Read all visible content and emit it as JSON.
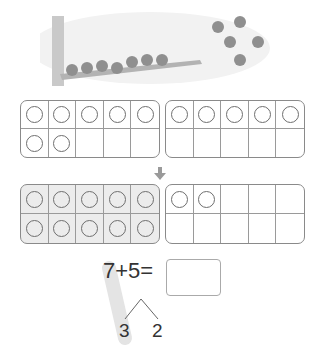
{
  "illustration": {
    "description": "Birds on a tree branch and birds flying",
    "birds_on_branch": 7,
    "birds_flying": 5
  },
  "top_frames": {
    "left": {
      "counters": 7
    },
    "right": {
      "counters": 5
    }
  },
  "arrow": "down-arrow",
  "bottom_frames": {
    "left": {
      "counters": 10,
      "highlighted": true
    },
    "right": {
      "counters": 2
    }
  },
  "equation": {
    "text": "7+5=",
    "answer": "",
    "split_left": "3",
    "split_right": "2"
  },
  "colors": {
    "frame_border": "#8a8a8a",
    "highlight_fill": "#ececec",
    "text": "#333333"
  }
}
